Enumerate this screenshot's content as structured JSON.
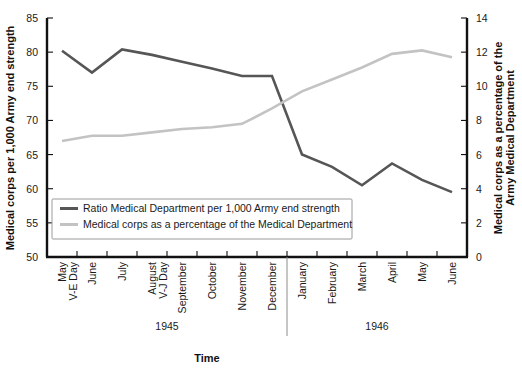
{
  "chart_data": {
    "type": "line",
    "title": "",
    "xlabel": "Time",
    "categories": [
      "May\nV-E Day",
      "June",
      "July",
      "August\nV-J Day",
      "September",
      "October",
      "November",
      "December",
      "January",
      "February",
      "March",
      "April",
      "May",
      "June"
    ],
    "category_lines": [
      [
        "May",
        "V-E Day"
      ],
      [
        "June"
      ],
      [
        "July"
      ],
      [
        "August",
        "V-J Day"
      ],
      [
        "September"
      ],
      [
        "October"
      ],
      [
        "November"
      ],
      [
        "December"
      ],
      [
        "January"
      ],
      [
        "February"
      ],
      [
        "March"
      ],
      [
        "April"
      ],
      [
        "May"
      ],
      [
        "June"
      ]
    ],
    "group_labels": [
      "1945",
      "1946"
    ],
    "group_split_after_index": 7,
    "left_axis": {
      "label": "Medical corps per 1,000 Army end strength",
      "ylim": [
        50,
        85
      ],
      "ticks": [
        50,
        55,
        60,
        65,
        70,
        75,
        80,
        85
      ]
    },
    "right_axis": {
      "label": "Medical corps as a percentage of the\nArmy Medical Department",
      "label_lines": [
        "Medical corps as a percentage of the",
        "Army Medical Department"
      ],
      "ylim": [
        0,
        14
      ],
      "ticks": [
        0,
        2,
        4,
        6,
        8,
        10,
        12,
        14
      ]
    },
    "grid": false,
    "legend_position": "inside-lower-left",
    "series": [
      {
        "name": "Ratio Medical Department per 1,000 Army end strength",
        "axis": "left",
        "color": "#565656",
        "values": [
          80.2,
          77.0,
          80.4,
          79.6,
          78.6,
          77.6,
          76.5,
          76.5,
          65.0,
          63.2,
          60.5,
          63.7,
          61.3,
          59.5
        ]
      },
      {
        "name": "Medical corps as a percentage of the Medical Department",
        "axis": "right",
        "color": "#c3c3c3",
        "values": [
          6.8,
          7.1,
          7.1,
          7.3,
          7.5,
          7.6,
          7.8,
          8.7,
          9.7,
          10.4,
          11.1,
          11.9,
          12.1,
          11.7
        ]
      }
    ]
  },
  "axis_titles": {
    "left": "Medical corps per 1,000 Army end strength",
    "right_line1": "Medical corps as a percentage of the",
    "right_line2": "Army Medical Department",
    "bottom": "Time"
  },
  "legend": {
    "items": [
      {
        "label": "Ratio Medical Department per 1,000 Army end strength",
        "color": "#565656"
      },
      {
        "label": "Medical corps as a percentage of the Medical Department",
        "color": "#c3c3c3"
      }
    ]
  }
}
